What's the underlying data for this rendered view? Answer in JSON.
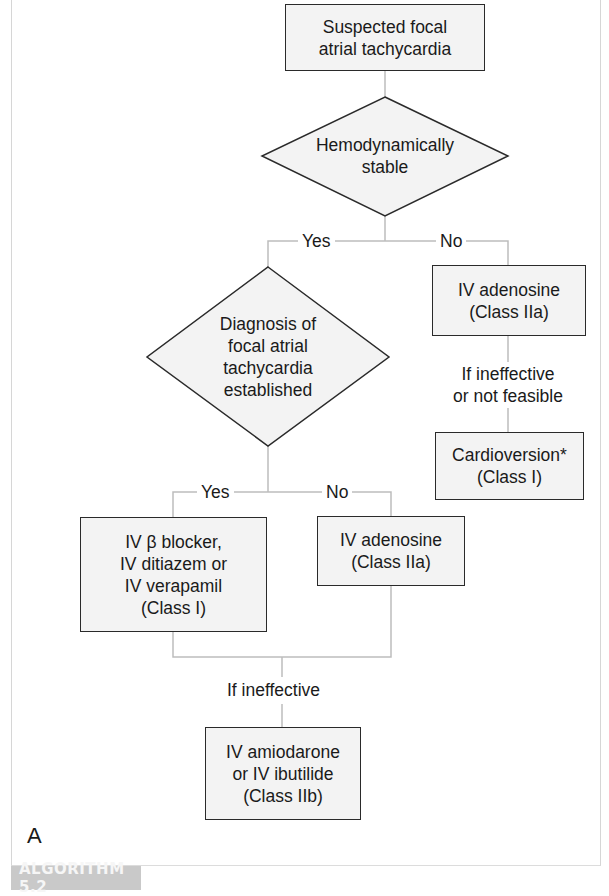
{
  "figure": {
    "panel_letter": "A",
    "caption_tag": "ALGORITHM 5.2"
  },
  "nodes": {
    "start": "Suspected focal\natrial tachycardia",
    "decision_stable": "Hemodynamically\nstable",
    "decision_diagnosis": "Diagnosis of\nfocal atrial\ntachycardia\nestablished",
    "unstable_adenosine": "IV adenosine\n(Class IIa)",
    "unstable_condition": "If ineffective\nor not feasible",
    "cardioversion": "Cardioversion*\n(Class I)",
    "beta_blocker": "IV β blocker,\nIV ditiazem or\nIV verapamil\n(Class I)",
    "stable_adenosine": "IV adenosine\n(Class IIa)",
    "merge_condition": "If ineffective",
    "amiodarone": "IV amiodarone\nor IV ibutilide\n(Class IIb)"
  },
  "edges": {
    "stable_yes": "Yes",
    "stable_no": "No",
    "diagnosis_yes": "Yes",
    "diagnosis_no": "No"
  },
  "colors": {
    "box_fill": "#f3f3f3",
    "box_border": "#2a2a2a",
    "connector": "#bdbdbd",
    "tag_bg": "#c9c9c9"
  }
}
